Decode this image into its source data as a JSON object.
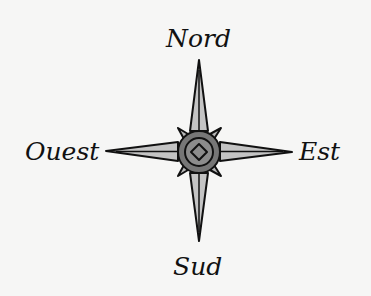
{
  "diagram": {
    "type": "compass-rose",
    "labels": {
      "north": "Nord",
      "south": "Sud",
      "west": "Ouest",
      "east": "Est"
    },
    "colors": {
      "background": "#f6f6f5",
      "arm_fill": "#c4c4c4",
      "outline": "#111111",
      "medallion_outer": "#767676",
      "medallion_inner": "#8c8c8c"
    }
  }
}
